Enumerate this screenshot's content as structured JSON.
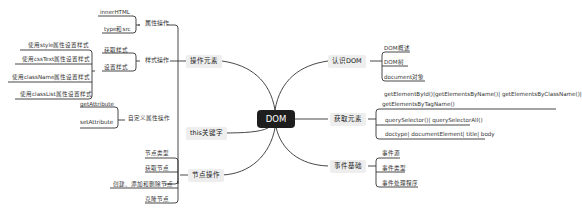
{
  "root": {
    "label": "DOM"
  },
  "branches": {
    "operate_elements": {
      "label": "操作元素",
      "children": {
        "attr_ops": {
          "label": "属性操作",
          "items": [
            "innerHTML",
            "type和src"
          ]
        },
        "style_ops": {
          "label": "样式操作",
          "items": [
            "获取样式",
            "设置样式"
          ],
          "set_style_items": [
            "使用style属性设置样式",
            "使用cssText属性设置样式",
            "使用className属性设置样式",
            "使用classList属性设置样式"
          ]
        },
        "custom_attr_ops": {
          "label": "自定义属性操作",
          "items": [
            "getAttribute",
            "setAttribute"
          ]
        }
      }
    },
    "this_keyword": {
      "label": "this关键字"
    },
    "node_ops": {
      "label": "节点操作",
      "items": [
        "节点类型",
        "获取节点",
        "创建、添加和删除节点",
        "克隆节点"
      ]
    },
    "know_dom": {
      "label": "认识DOM",
      "items": [
        "DOM概述",
        "DOM树",
        "document对象"
      ]
    },
    "get_elements": {
      "label": "获取元素",
      "items": [
        "getElementById()|getElementsByName()| getElementsByClassName()|",
        "getElementsByTagName()",
        "querySelector()| querySelectorAll()",
        "doctype| documentElement| title| body"
      ]
    },
    "event_basics": {
      "label": "事件基础",
      "items": [
        "事件源",
        "事件类型",
        "事件处理程序"
      ]
    }
  },
  "colors": {
    "root_bg": "#1e1e1e",
    "branch_bg": "#eeeeee",
    "line": "#333333"
  }
}
